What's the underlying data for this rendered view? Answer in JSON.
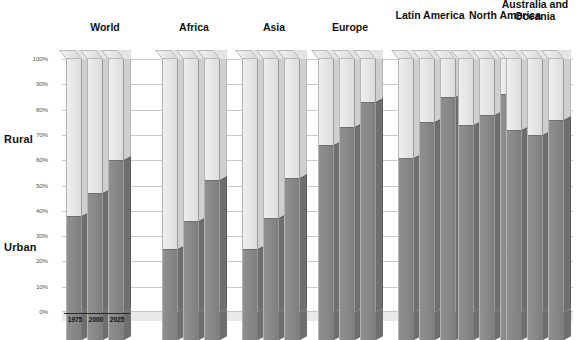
{
  "chart_data": {
    "type": "bar",
    "title": "",
    "subtitle": "",
    "xlabel": "",
    "ylabel": "",
    "ylim": [
      0,
      100
    ],
    "grid": true,
    "legend_position": "left-axis-labels",
    "stacked": true,
    "categories": [
      "World",
      "Africa",
      "Asia",
      "Europe",
      "Latin America",
      "North America",
      "Australia and Oceania"
    ],
    "x": [
      "1975",
      "2000",
      "2025"
    ],
    "y_ticks": [
      "0%",
      "10%",
      "20%",
      "30%",
      "40%",
      "50%",
      "60%",
      "70%",
      "80%",
      "90%",
      "100%"
    ],
    "segment_labels": [
      "Urban",
      "Rural"
    ],
    "series": [
      {
        "name": "Urban",
        "color": "#878787",
        "values": {
          "World": [
            38,
            47,
            60
          ],
          "Africa": [
            25,
            36,
            52
          ],
          "Asia": [
            25,
            37,
            53
          ],
          "Europe": [
            66,
            73,
            83
          ],
          "Latin America": [
            61,
            75,
            85
          ],
          "North America": [
            74,
            78,
            86
          ],
          "Australia and Oceania": [
            72,
            70,
            76
          ]
        }
      },
      {
        "name": "Rural",
        "color": "#e6e6e6",
        "values": {
          "World": [
            62,
            53,
            40
          ],
          "Africa": [
            75,
            64,
            48
          ],
          "Asia": [
            75,
            63,
            47
          ],
          "Europe": [
            34,
            27,
            17
          ],
          "Latin America": [
            39,
            25,
            15
          ],
          "North America": [
            26,
            22,
            14
          ],
          "Australia and Oceania": [
            28,
            30,
            24
          ]
        }
      }
    ]
  },
  "axis": {
    "side_labels": {
      "rural": "Rural",
      "urban": "Urban"
    },
    "year_labels": [
      "1975",
      "2000",
      "2025"
    ]
  },
  "colors": {
    "urban": "#878787",
    "rural": "#e6e6e6",
    "grid": "#c9c9c9",
    "text": "#111111",
    "tick_text": "#555555"
  }
}
